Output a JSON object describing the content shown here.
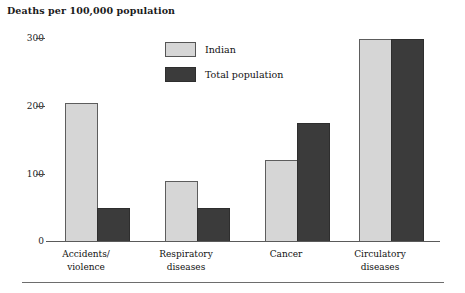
{
  "figure": {
    "axis_title": "Deaths per 100,000 population"
  },
  "legend": {
    "position": "top-center",
    "items": [
      {
        "label": "Indian",
        "swatch": "light-gray",
        "color": "#d6d6d6"
      },
      {
        "label": "Total population",
        "swatch": "dark-gray",
        "color": "#3b3b3b"
      }
    ]
  },
  "axes": {
    "y_ticks": [
      "300",
      "200",
      "100",
      "0"
    ],
    "y_tick_values": [
      300,
      200,
      100,
      0
    ]
  },
  "categories_display": [
    {
      "line1": "Accidents/",
      "line2": "violence"
    },
    {
      "line1": "Respiratory",
      "line2": "diseases"
    },
    {
      "line1": "Cancer",
      "line2": ""
    },
    {
      "line1": "Circulatory",
      "line2": "diseases"
    }
  ],
  "chart_data": {
    "type": "bar",
    "title": "Deaths per 100,000 population",
    "xlabel": "",
    "ylabel": "Deaths per 100,000 population",
    "ylim": [
      0,
      300
    ],
    "yticks": [
      0,
      100,
      200,
      300
    ],
    "grid": false,
    "legend_position": "top-center",
    "categories": [
      "Accidents/violence",
      "Respiratory diseases",
      "Cancer",
      "Circulatory diseases"
    ],
    "series": [
      {
        "name": "Indian",
        "color": "#d6d6d6",
        "values": [
          205,
          90,
          120,
          298
        ]
      },
      {
        "name": "Total population",
        "color": "#3b3b3b",
        "values": [
          50,
          50,
          175,
          298
        ]
      }
    ]
  }
}
